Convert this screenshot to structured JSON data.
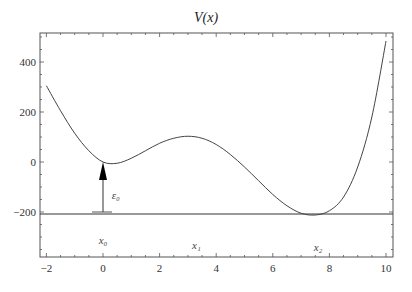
{
  "chart_data": {
    "type": "line",
    "title": "V(x)",
    "xlabel": "",
    "ylabel": "",
    "xlim": [
      -2.2,
      10.2
    ],
    "ylim": [
      -380,
      516
    ],
    "grid": false,
    "x_ticks": [
      -2,
      0,
      2,
      4,
      6,
      8,
      10
    ],
    "y_ticks": [
      -200,
      0,
      200,
      400
    ],
    "x_tick_labels": [
      "−2",
      "0",
      "2",
      "4",
      "6",
      "8",
      "10"
    ],
    "y_tick_labels": [
      "−200",
      "0",
      "200",
      "400"
    ],
    "series": [
      {
        "name": "V(x)",
        "x": [
          -2,
          -1.5,
          -1,
          -0.5,
          0,
          0.5,
          1,
          1.5,
          2,
          2.5,
          3,
          3.5,
          4,
          4.5,
          5,
          5.5,
          6,
          6.5,
          7,
          7.5,
          8,
          8.5,
          9,
          9.5,
          10
        ],
        "y": [
          305,
          205,
          115,
          45,
          0,
          -5,
          15,
          45,
          75,
          95,
          103,
          95,
          70,
          30,
          -20,
          -75,
          -130,
          -175,
          -205,
          -212,
          -195,
          -140,
          -20,
          180,
          484
        ]
      }
    ],
    "reference_line": {
      "y": -208,
      "label": ""
    },
    "annotations": [
      {
        "text": "x₀",
        "x": 0,
        "y": -310
      },
      {
        "text": "x₁",
        "x": 3.3,
        "y": -330
      },
      {
        "text": "x₂",
        "x": 7.6,
        "y": -340
      },
      {
        "text": "ε₀",
        "x": 0.45,
        "y": -130,
        "arrow": {
          "from": [
            0,
            -205
          ],
          "to": [
            0,
            0
          ]
        }
      }
    ]
  }
}
